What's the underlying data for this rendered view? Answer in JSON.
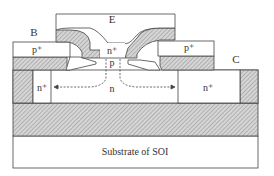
{
  "diagram": {
    "labels": {
      "emitter": "E",
      "base": "B",
      "collector": "C",
      "base_contact_left": "p⁺",
      "base_contact_right": "p⁺",
      "emitter_region": "n⁺",
      "intrinsic_base": "p",
      "collector_left": "n⁺",
      "drift_region": "n",
      "collector_right": "n⁺",
      "substrate": "Substrate of SOI"
    },
    "colors": {
      "line": "#444444",
      "hatch": "#9a9a9a",
      "fill": "#ffffff"
    }
  }
}
